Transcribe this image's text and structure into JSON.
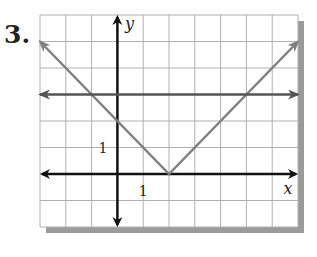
{
  "problem_number": "3.",
  "chart_data": {
    "type": "line",
    "title": "",
    "xlabel": "x",
    "ylabel": "y",
    "xlim": [
      -3,
      7
    ],
    "ylim": [
      -2,
      6
    ],
    "grid": true,
    "tick_labels": {
      "x": [
        {
          "value": 1,
          "label": "1"
        }
      ],
      "y": [
        {
          "value": 1,
          "label": "1"
        }
      ]
    },
    "series": [
      {
        "name": "absolute-value-v",
        "description": "y = |x - 2|",
        "color": "#808080",
        "arrows": "both",
        "points": [
          [
            -3,
            5
          ],
          [
            2,
            0
          ],
          [
            7,
            5
          ]
        ]
      },
      {
        "name": "horizontal-line",
        "description": "y = 3",
        "color": "#555555",
        "arrows": "both",
        "points": [
          [
            -3,
            3
          ],
          [
            7,
            3
          ]
        ]
      }
    ],
    "colors": {
      "grid": "#b0b0b0",
      "axes": "#111111",
      "shadow": "#9a9a9a"
    }
  }
}
